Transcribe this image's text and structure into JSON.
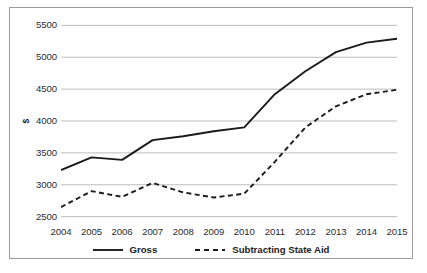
{
  "chart_data": {
    "type": "line",
    "title": "",
    "xlabel": "",
    "ylabel": "$",
    "categories": [
      "2004",
      "2005",
      "2006",
      "2007",
      "2008",
      "2009",
      "2010",
      "2011",
      "2012",
      "2013",
      "2014",
      "2015"
    ],
    "ylim": [
      2400,
      5600
    ],
    "yticks": [
      2500,
      3000,
      3500,
      4000,
      4500,
      5000,
      5500
    ],
    "ytick_labels": [
      "2500",
      "3000",
      "3500",
      "4000",
      "4500",
      "5000",
      "5500"
    ],
    "grid": "horizontal",
    "legend_position": "bottom-center",
    "series": [
      {
        "name": "Gross",
        "style": "solid",
        "color": "#1a1a1a",
        "values": [
          3230,
          3430,
          3390,
          3700,
          3760,
          3840,
          3900,
          4420,
          4780,
          5080,
          5230,
          5290
        ]
      },
      {
        "name": "Subtracting State Aid",
        "style": "dashed",
        "color": "#1a1a1a",
        "values": [
          2650,
          2900,
          2810,
          3030,
          2880,
          2800,
          2860,
          3360,
          3900,
          4230,
          4420,
          4490
        ]
      }
    ]
  },
  "legend": {
    "items": [
      {
        "label": "Gross",
        "style": "solid"
      },
      {
        "label": "Subtracting State Aid",
        "style": "dashed"
      }
    ]
  },
  "axes": {
    "y_label": "$"
  }
}
